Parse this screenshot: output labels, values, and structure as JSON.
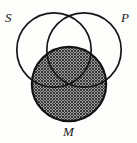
{
  "figure": {
    "type": "euler-venn-diagram",
    "width": 137,
    "height": 143,
    "background_color": "#fdfdfc",
    "stroke_color": "#1a1a1a",
    "shading_color": "#3a3a3a"
  },
  "labels": {
    "s": "S",
    "p": "P",
    "m": "M"
  },
  "circles": [
    {
      "id": "S",
      "label": "S",
      "cx": 54,
      "cy": 50,
      "r": 38,
      "shaded": false
    },
    {
      "id": "P",
      "label": "P",
      "cx": 84,
      "cy": 50,
      "r": 38,
      "shaded": false
    },
    {
      "id": "M",
      "label": "M",
      "cx": 69,
      "cy": 84,
      "r": 38,
      "shaded": true
    }
  ]
}
